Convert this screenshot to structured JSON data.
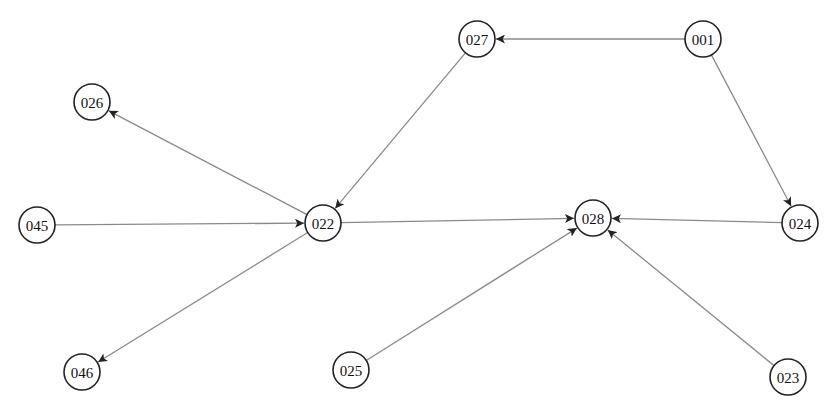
{
  "diagram": {
    "type": "directed-graph",
    "node_radius": 18,
    "colors": {
      "edge": "#8a8a8a",
      "node_stroke": "#222222",
      "arrowhead": "#222222",
      "background": "#ffffff"
    },
    "nodes": [
      {
        "id": "001",
        "label": "001",
        "x": 703,
        "y": 39
      },
      {
        "id": "027",
        "label": "027",
        "x": 477,
        "y": 39
      },
      {
        "id": "026",
        "label": "026",
        "x": 92,
        "y": 102
      },
      {
        "id": "045",
        "label": "045",
        "x": 37,
        "y": 225
      },
      {
        "id": "022",
        "label": "022",
        "x": 323,
        "y": 223
      },
      {
        "id": "028",
        "label": "028",
        "x": 593,
        "y": 218
      },
      {
        "id": "024",
        "label": "024",
        "x": 800,
        "y": 223
      },
      {
        "id": "046",
        "label": "046",
        "x": 82,
        "y": 372
      },
      {
        "id": "025",
        "label": "025",
        "x": 351,
        "y": 370
      },
      {
        "id": "023",
        "label": "023",
        "x": 788,
        "y": 377
      }
    ],
    "edges": [
      {
        "from": "001",
        "to": "027"
      },
      {
        "from": "001",
        "to": "024"
      },
      {
        "from": "027",
        "to": "022"
      },
      {
        "from": "022",
        "to": "026"
      },
      {
        "from": "045",
        "to": "022"
      },
      {
        "from": "022",
        "to": "046"
      },
      {
        "from": "022",
        "to": "028"
      },
      {
        "from": "024",
        "to": "028"
      },
      {
        "from": "025",
        "to": "028"
      },
      {
        "from": "023",
        "to": "028"
      }
    ]
  }
}
